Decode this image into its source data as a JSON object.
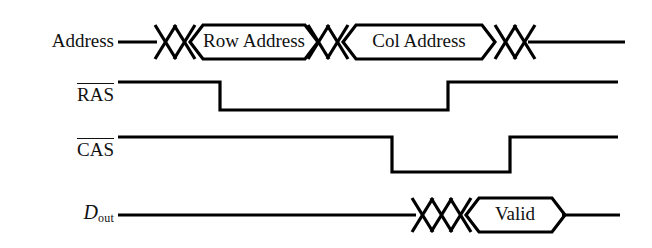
{
  "diagram": {
    "background_color": "#ffffff",
    "line_color": "#000000",
    "text_color": "#111111",
    "width": 652,
    "height": 248
  },
  "signals": [
    {
      "id": "address",
      "label": "Address",
      "label_kind": "plain",
      "active_low": false,
      "row_center_y": 42,
      "type": "bus",
      "segments": [
        {
          "kind": "line",
          "from_x": 118,
          "to_x": 155
        },
        {
          "kind": "crossover",
          "from_x": 155,
          "to_x": 193
        },
        {
          "kind": "bus",
          "from_x": 193,
          "to_x": 305,
          "value": "Row Address"
        },
        {
          "kind": "crossover",
          "from_x": 305,
          "to_x": 345
        },
        {
          "kind": "bus",
          "from_x": 345,
          "to_x": 495,
          "value": "Col Address"
        },
        {
          "kind": "crossover",
          "from_x": 495,
          "to_x": 535
        },
        {
          "kind": "line",
          "from_x": 535,
          "to_x": 625
        }
      ]
    },
    {
      "id": "ras",
      "label": "RAS",
      "label_kind": "overbar",
      "active_low": true,
      "row_high_y": 82,
      "row_low_y": 110,
      "type": "digital",
      "transitions": [
        {
          "x": 118,
          "level": "high"
        },
        {
          "x": 220,
          "level": "low"
        },
        {
          "x": 448,
          "level": "high"
        },
        {
          "x": 618,
          "level": "end"
        }
      ]
    },
    {
      "id": "cas",
      "label": "CAS",
      "label_kind": "overbar",
      "active_low": true,
      "row_high_y": 137,
      "row_low_y": 172,
      "type": "digital",
      "transitions": [
        {
          "x": 118,
          "level": "high"
        },
        {
          "x": 392,
          "level": "low"
        },
        {
          "x": 510,
          "level": "high"
        },
        {
          "x": 618,
          "level": "end"
        }
      ]
    },
    {
      "id": "dout",
      "label": "D",
      "label_subscript": "out",
      "label_kind": "italic-subscript",
      "active_low": false,
      "row_center_y": 215,
      "type": "bus",
      "segments": [
        {
          "kind": "line",
          "from_x": 118,
          "to_x": 412
        },
        {
          "kind": "crossover",
          "from_x": 412,
          "to_x": 440
        },
        {
          "kind": "crossover",
          "from_x": 440,
          "to_x": 468
        },
        {
          "kind": "bus",
          "from_x": 468,
          "to_x": 565,
          "value": "Valid"
        },
        {
          "kind": "line",
          "from_x": 565,
          "to_x": 620
        }
      ]
    }
  ],
  "bus_values": {
    "row_address": "Row Address",
    "col_address": "Col Address",
    "valid": "Valid"
  },
  "labels": {
    "address": "Address",
    "ras": "RAS",
    "cas": "CAS",
    "dout_base": "D",
    "dout_sub": "out"
  },
  "geometry": {
    "bus_half_height": 17,
    "bus_bevel": 13,
    "stroke_width": 3.2
  }
}
